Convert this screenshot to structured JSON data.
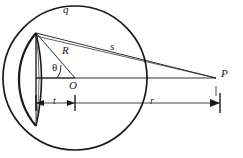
{
  "figure": {
    "background_color": "#ffffff",
    "stroke_color": "#1a1a1a",
    "labels": {
      "arc_charge": "q",
      "radius": "R",
      "slant_distance": "s",
      "angle": "θ",
      "center": "O",
      "point": "P",
      "cap_thickness": "t",
      "distance_to_point": "r"
    },
    "geometry": {
      "circle_center_x": 75,
      "circle_center_y": 78,
      "circle_radius": 72,
      "cap_vertex_top_x": 36,
      "cap_vertex_top_y": 33,
      "cap_vertex_bottom_x": 36,
      "cap_vertex_bottom_y": 126,
      "cap_left_x": 13,
      "point_p_x": 216,
      "point_p_y": 78,
      "dimension_line_y": 103,
      "angle_degrees": 34
    }
  }
}
